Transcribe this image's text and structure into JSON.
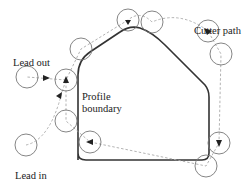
{
  "diagram": {
    "labels": {
      "lead_out": "Lead out",
      "cutter_path": "Cutter path",
      "profile_line1": "Profile",
      "profile_line2": "boundary",
      "lead_in": "Lead in"
    },
    "colors": {
      "boundary": "#333333",
      "cutter_circle": "#777777",
      "path_dashed": "#aaaaaa",
      "arrow": "#222222",
      "text": "#222222"
    },
    "cutter_radius": 11,
    "cutter_positions": [
      {
        "name": "lead-in-start",
        "x": 26,
        "y": 145
      },
      {
        "name": "left-upper",
        "x": 66,
        "y": 80
      },
      {
        "name": "left-lower",
        "x": 66,
        "y": 121
      },
      {
        "name": "bottom-left-corner",
        "x": 90,
        "y": 142
      },
      {
        "name": "bottom-right-corner",
        "x": 206,
        "y": 166
      },
      {
        "name": "right-lower",
        "x": 219,
        "y": 143
      },
      {
        "name": "right-upper",
        "x": 221,
        "y": 54
      },
      {
        "name": "top-right-diagonal",
        "x": 208,
        "y": 31
      },
      {
        "name": "top-right",
        "x": 152,
        "y": 22
      },
      {
        "name": "top-center",
        "x": 128,
        "y": 20
      },
      {
        "name": "top-left-diagonal",
        "x": 81,
        "y": 49
      },
      {
        "name": "lead-out-end",
        "x": 27,
        "y": 77
      }
    ]
  }
}
